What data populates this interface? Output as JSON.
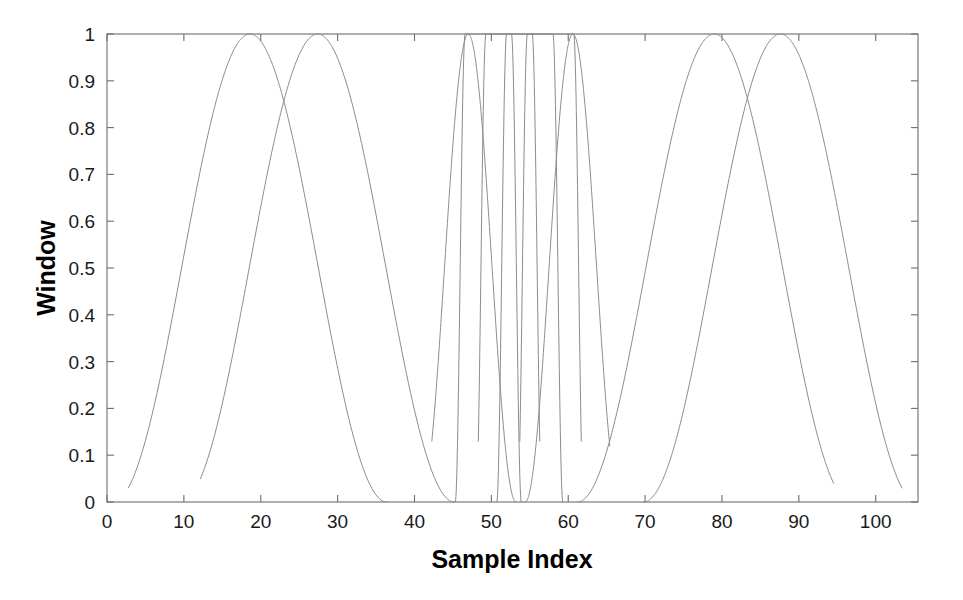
{
  "chart_data": {
    "type": "line",
    "title": "",
    "xlabel": "Sample Index",
    "ylabel": "Window",
    "xlim": [
      0,
      105.5
    ],
    "ylim": [
      0,
      1
    ],
    "grid": false,
    "legend": null,
    "xticks": [
      0,
      10,
      20,
      30,
      40,
      50,
      60,
      70,
      80,
      90,
      100
    ],
    "xticklabels": [
      "0",
      "10",
      "20",
      "30",
      "40",
      "50",
      "60",
      "70",
      "80",
      "90",
      "100"
    ],
    "yticks": [
      0,
      0.1,
      0.2,
      0.3,
      0.4,
      0.5,
      0.6,
      0.7,
      0.8,
      0.9,
      1
    ],
    "yticklabels": [
      "0",
      "0.1",
      "0.2",
      "0.3",
      "0.4",
      "0.5",
      "0.6",
      "0.7",
      "0.8",
      "0.9",
      "1"
    ],
    "line_color": "#8c8c8c",
    "line_width": 1.0,
    "axis_color": "#6e6e6e",
    "series": [
      {
        "name": "window-1",
        "center": 18.6,
        "half_width": 17.8,
        "peak": 1,
        "start_level": 0.03,
        "end_level": 0.0,
        "flat_top": 0.0
      },
      {
        "name": "window-2",
        "center": 27.4,
        "half_width": 17.8,
        "peak": 1,
        "start_level": 0.05,
        "end_level": 0.0,
        "flat_top": 0.0
      },
      {
        "name": "window-3",
        "center": 47.0,
        "half_width": 6.2,
        "peak": 1,
        "start_level": 0.13,
        "end_level": 0.0,
        "flat_top": 0.0
      },
      {
        "name": "window-4",
        "center": 49.6,
        "half_width": 4.3,
        "peak": 1,
        "start_level": 0.0,
        "end_level": 0.0,
        "flat_top": 0.7
      },
      {
        "name": "window-5",
        "center": 52.3,
        "half_width": 4.3,
        "peak": 1,
        "start_level": 0.13,
        "end_level": 0.13,
        "flat_top": 0.7
      },
      {
        "name": "window-6",
        "center": 55.0,
        "half_width": 4.3,
        "peak": 1,
        "start_level": 0.0,
        "end_level": 0.0,
        "flat_top": 0.7
      },
      {
        "name": "window-7",
        "center": 57.7,
        "half_width": 4.3,
        "peak": 1,
        "start_level": 0.13,
        "end_level": 0.13,
        "flat_top": 0.7
      },
      {
        "name": "window-8",
        "center": 60.6,
        "half_width": 6.2,
        "peak": 1,
        "start_level": 0.0,
        "end_level": 0.12,
        "flat_top": 0.0
      },
      {
        "name": "window-9",
        "center": 79.0,
        "half_width": 17.8,
        "peak": 1,
        "start_level": 0.0,
        "end_level": 0.04,
        "flat_top": 0.0
      },
      {
        "name": "window-10",
        "center": 87.6,
        "half_width": 17.8,
        "peak": 1,
        "start_level": 0.0,
        "end_level": 0.03,
        "flat_top": 0.0
      }
    ]
  },
  "axes": {
    "x_title": "Sample Index",
    "y_title": "Window"
  }
}
